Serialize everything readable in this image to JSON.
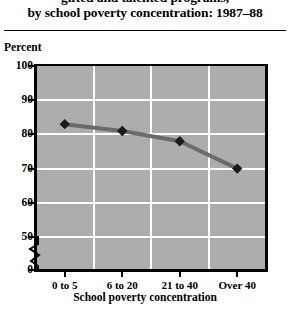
{
  "title": {
    "line1": "gifted and talented programs,",
    "line2": "by school poverty concentration: 1987–88"
  },
  "axis": {
    "y_title": "Percent",
    "x_title": "School poverty concentration"
  },
  "chart_data": {
    "type": "line",
    "title": "gifted and talented programs, by school poverty concentration: 1987–88",
    "xlabel": "School poverty concentration",
    "ylabel": "Percent",
    "categories": [
      "0 to 5",
      "6 to 20",
      "21 to 40",
      "Over 40"
    ],
    "values": [
      83,
      81,
      78,
      70
    ],
    "ylim": [
      50,
      100
    ],
    "y_ticks": [
      "100",
      "90",
      "80",
      "70",
      "60",
      "50",
      "0"
    ],
    "y_tick_values": [
      100,
      90,
      80,
      70,
      60,
      50,
      0
    ],
    "y_axis_break": true,
    "grid": true,
    "legend": "none",
    "plot_background": "#adadad",
    "gridline_color": "#ffffff",
    "series_color": "#6b6b6b",
    "marker_color": "#1a1a1a",
    "marker_shape": "diamond"
  }
}
